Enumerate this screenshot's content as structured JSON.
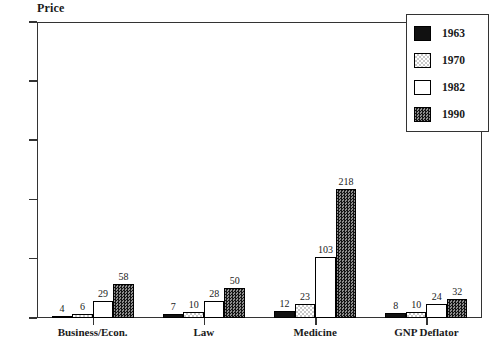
{
  "chart_data": {
    "type": "bar",
    "title": "",
    "ylabel": "Price",
    "xlabel": "",
    "ylim": [
      0,
      500
    ],
    "yticks": [
      0,
      100,
      200,
      300,
      400,
      500
    ],
    "grid": false,
    "legend_position": "top-right",
    "categories": [
      "Business/Econ.",
      "Law",
      "Medicine",
      "GNP Deflator"
    ],
    "series": [
      {
        "name": "1963",
        "values": [
          4,
          7,
          12,
          8
        ]
      },
      {
        "name": "1970",
        "values": [
          6,
          10,
          23,
          10
        ]
      },
      {
        "name": "1982",
        "values": [
          29,
          28,
          103,
          24
        ]
      },
      {
        "name": "1990",
        "values": [
          58,
          50,
          218,
          32
        ]
      }
    ]
  },
  "legend": {
    "entries": [
      {
        "label": "1963",
        "pattern": "solid-black"
      },
      {
        "label": "1970",
        "pattern": "light-dotted"
      },
      {
        "label": "1982",
        "pattern": "white-empty"
      },
      {
        "label": "1990",
        "pattern": "dense-checker"
      }
    ]
  },
  "colors": {
    "axis": "#333333",
    "text": "#1a1a1a",
    "background": "#ffffff",
    "series_1963": "#111111",
    "series_1970": "#c9c9c9",
    "series_1982": "#ffffff",
    "series_1990": "#3a3a3a"
  }
}
